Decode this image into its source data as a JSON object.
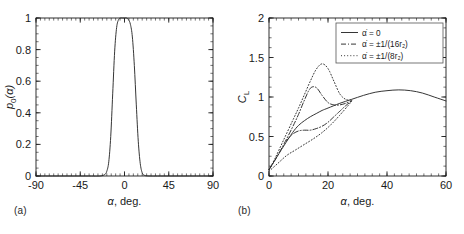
{
  "figure": {
    "panels": [
      {
        "id": "a",
        "label": "(a)",
        "xlabel_sym": "α",
        "xlabel_rest": ", deg.",
        "ylabel": "p0(α)",
        "ylabel_sym": "p",
        "ylabel_sub": "0",
        "ylabel_tail": "(α)"
      },
      {
        "id": "b",
        "label": "(b)",
        "xlabel_sym": "α",
        "xlabel_rest": ", deg.",
        "ylabel": "CL",
        "ylabel_sym": "C",
        "ylabel_sub": "L"
      }
    ]
  },
  "chart_data": [
    {
      "type": "line",
      "panel": "a",
      "title": "",
      "xlabel": "α, deg.",
      "ylabel": "p_0(α)",
      "xlim": [
        -90,
        90
      ],
      "ylim": [
        0,
        1
      ],
      "xticks": [
        -90,
        -45,
        0,
        45,
        90
      ],
      "xtick_labels": [
        "-90",
        "-45",
        "0",
        "45",
        "90"
      ],
      "yticks": [
        0,
        0.2,
        0.4,
        0.6,
        0.8,
        1
      ],
      "ytick_labels": [
        "0",
        "0.2",
        "0.4",
        "0.6",
        "0.8",
        "1"
      ],
      "minor_ticks": true,
      "grid": false,
      "legend": null,
      "series": [
        {
          "name": "p_0(α)",
          "style": "solid",
          "description": "narrow flat-topped super-Gaussian pulse centred near α = -1 deg, unity plateau from about -6 to +4 deg, falling to zero near ±17 deg",
          "x": [
            -90,
            -40,
            -25,
            -20,
            -18,
            -16,
            -14,
            -12,
            -10,
            -8,
            -6,
            -4,
            -2,
            0,
            2,
            4,
            6,
            8,
            10,
            12,
            14,
            16,
            18,
            20,
            25,
            40,
            90
          ],
          "y": [
            0,
            0,
            0,
            0.01,
            0.03,
            0.09,
            0.25,
            0.52,
            0.79,
            0.94,
            0.99,
            1.0,
            1.0,
            1.0,
            1.0,
            0.99,
            0.96,
            0.88,
            0.7,
            0.45,
            0.22,
            0.08,
            0.02,
            0.005,
            0,
            0,
            0
          ]
        }
      ]
    },
    {
      "type": "line",
      "panel": "b",
      "title": "",
      "xlabel": "α, deg.",
      "ylabel": "C_L",
      "xlim": [
        0,
        60
      ],
      "ylim": [
        0,
        2
      ],
      "xticks": [
        0,
        20,
        40,
        60
      ],
      "xtick_labels": [
        "0",
        "20",
        "40",
        "60"
      ],
      "yticks": [
        0,
        0.5,
        1,
        1.5,
        2
      ],
      "ytick_labels": [
        "0",
        "0.5",
        "1",
        "1.5",
        "2"
      ],
      "minor_ticks": true,
      "grid": false,
      "legend_position": "top-right",
      "series": [
        {
          "name": "adot = 0",
          "legend_prefix": "α̇ = 0",
          "style": "solid",
          "description": "static lift curve rising linearly then stalling, peak 1.09 near 44 deg",
          "x": [
            0,
            2,
            5,
            8,
            10,
            12,
            14,
            16,
            18,
            20,
            24,
            28,
            32,
            36,
            40,
            44,
            48,
            52,
            56,
            60
          ],
          "y": [
            0.08,
            0.2,
            0.38,
            0.55,
            0.64,
            0.7,
            0.75,
            0.79,
            0.83,
            0.86,
            0.92,
            0.97,
            1.02,
            1.06,
            1.08,
            1.09,
            1.08,
            1.05,
            1.0,
            0.95
          ]
        },
        {
          "name": "adot = +-1/(16 r2)",
          "legend_prefix": "α̇ = ±1/(16r₂)",
          "style": "dash-dot",
          "description": "moderate-rate hysteresis loop: upstroke overshoot to 1.12 at 14 deg then drop, downstroke branch flat near 0.55-0.6",
          "upstroke_x": [
            0,
            2,
            5,
            8,
            10,
            12,
            14,
            16,
            18,
            20,
            22,
            24,
            26,
            28
          ],
          "upstroke_y": [
            0.08,
            0.2,
            0.4,
            0.62,
            0.78,
            0.96,
            1.11,
            1.12,
            1.02,
            0.93,
            0.9,
            0.9,
            0.92,
            0.95
          ],
          "downstroke_x": [
            6,
            8,
            10,
            12,
            14,
            16,
            18,
            20,
            22,
            24,
            26,
            28
          ],
          "downstroke_y": [
            0.45,
            0.53,
            0.57,
            0.58,
            0.58,
            0.6,
            0.63,
            0.68,
            0.75,
            0.82,
            0.89,
            0.95
          ]
        },
        {
          "name": "adot = +-1/(8 r2)",
          "legend_prefix": "α̇ = ±1/(8r₂)",
          "style": "dotted",
          "description": "high-rate hysteresis loop: large upstroke overshoot to 1.42 at 18 deg, downstroke branch low near 0.3-0.5",
          "upstroke_x": [
            0,
            2,
            5,
            8,
            10,
            12,
            14,
            16,
            18,
            20,
            22,
            24,
            26,
            28
          ],
          "upstroke_y": [
            0.08,
            0.22,
            0.46,
            0.7,
            0.86,
            1.03,
            1.2,
            1.35,
            1.42,
            1.36,
            1.2,
            1.04,
            0.97,
            0.96
          ],
          "downstroke_x": [
            0,
            3,
            6,
            9,
            12,
            15,
            18,
            21,
            24,
            27,
            28
          ],
          "downstroke_y": [
            0.06,
            0.16,
            0.26,
            0.33,
            0.4,
            0.47,
            0.55,
            0.65,
            0.77,
            0.9,
            0.95
          ]
        }
      ],
      "legend_entries": [
        {
          "style": "solid",
          "text": "α̇ = 0"
        },
        {
          "style": "dash-dot",
          "text": "α̇ = ±1/(16r₂)"
        },
        {
          "style": "dotted",
          "text": "α̇ = ±1/(8r₂)"
        }
      ]
    }
  ]
}
